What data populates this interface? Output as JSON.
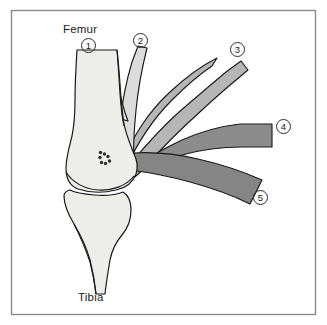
{
  "figure": {
    "frame": {
      "x": 11,
      "y": 10,
      "width": 305,
      "height": 305,
      "stroke_color": "#8a8a8a",
      "background_color": "#ffffff"
    },
    "text_labels": [
      {
        "id": "femur",
        "text": "Femur",
        "x": 63,
        "y": 24
      },
      {
        "id": "tibia",
        "text": "Tibia",
        "x": 78,
        "y": 292
      }
    ],
    "callouts": [
      {
        "id": "callout-1",
        "number": "1",
        "x": 81,
        "y": 38,
        "points_to": "femur-shaft"
      },
      {
        "id": "callout-2",
        "number": "2",
        "x": 133,
        "y": 33,
        "points_to": "light-gray-band"
      },
      {
        "id": "callout-3",
        "number": "3",
        "x": 230,
        "y": 42,
        "points_to": "medium-gray-band"
      },
      {
        "id": "callout-4",
        "number": "4",
        "x": 276,
        "y": 119,
        "points_to": "dark-gray-horizontal-band"
      },
      {
        "id": "callout-5",
        "number": "5",
        "x": 253,
        "y": 190,
        "points_to": "dark-gray-descending-band"
      }
    ],
    "colors": {
      "bone_fill": "#ededea",
      "band_light": "#dcdcdc",
      "band_medium": "#b6b6b6",
      "band_dark": "#8c8c8c",
      "band_darker": "#858585",
      "outline": "#1a1a1a",
      "frame": "#8a8a8a",
      "marker_dots": "#2e2e2e",
      "page_background": "#ffffff"
    },
    "structures": [
      {
        "id": "femur-shaft",
        "callout": "1",
        "shade": "bone_fill",
        "description": "Femoral shaft descending from top of frame"
      },
      {
        "id": "light-gray-band",
        "callout": "2",
        "shade": "band_light",
        "description": "Light gray band running up and to the right from the joint"
      },
      {
        "id": "medium-gray-band",
        "callout": "3",
        "shade": "band_medium",
        "description": "Medium gray band fanning up and to the right"
      },
      {
        "id": "dark-gray-horizontal-band",
        "callout": "4",
        "shade": "band_dark",
        "description": "Dark gray band running horizontally to the right edge"
      },
      {
        "id": "dark-gray-descending-band",
        "callout": "5",
        "shade": "band_darker",
        "description": "Dark gray band descending to the lower right"
      },
      {
        "id": "tibia-bone",
        "callout": "",
        "shade": "bone_fill",
        "description": "Tibia descending below the joint line"
      },
      {
        "id": "marker-dots",
        "callout": "",
        "shade": "marker_dots",
        "description": "Cluster of small dark markers inside the femoral condyle"
      }
    ],
    "marker_dots": [
      {
        "cx": 100.5,
        "cy": 152.5,
        "r": 1.7
      },
      {
        "cx": 100.0,
        "cy": 157.5,
        "r": 1.7
      },
      {
        "cx": 104.5,
        "cy": 154.0,
        "r": 1.7
      },
      {
        "cx": 108.0,
        "cy": 156.5,
        "r": 1.7
      },
      {
        "cx": 109.5,
        "cy": 161.0,
        "r": 1.7
      },
      {
        "cx": 105.5,
        "cy": 163.5,
        "r": 1.7
      },
      {
        "cx": 101.5,
        "cy": 162.5,
        "r": 1.7
      }
    ]
  }
}
